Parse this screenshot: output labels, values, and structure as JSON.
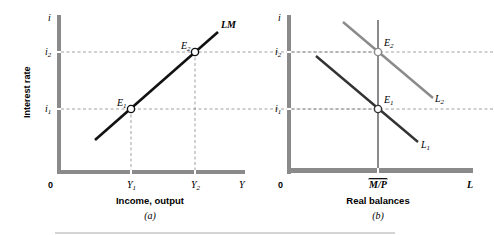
{
  "panel_a": {
    "y_axis_symbol": "i",
    "y_axis_title": "Interest rate",
    "tick_i2": "i",
    "tick_i2_sub": "2",
    "tick_i1": "i",
    "tick_i1_sub": "1",
    "origin": "0",
    "tick_y1": "Y",
    "tick_y1_sub": "1",
    "tick_y2": "Y",
    "tick_y2_sub": "2",
    "x_axis_symbol": "Y",
    "x_axis_title": "Income, output",
    "caption": "(a)",
    "curve_label": "LM",
    "point_e1": "E",
    "point_e1_sub": "1",
    "point_e2": "E",
    "point_e2_sub": "2"
  },
  "panel_b": {
    "y_axis_symbol": "i",
    "tick_i2": "i",
    "tick_i2_sub": "2",
    "tick_i1": "i",
    "tick_i1_sub": "1",
    "origin": "0",
    "tick_mp": "M/P",
    "x_axis_symbol": "L",
    "x_axis_title": "Real balances",
    "caption": "(b)",
    "curve_l1": "L",
    "curve_l1_sub": "1",
    "curve_l2": "L",
    "curve_l2_sub": "2",
    "point_e1": "E",
    "point_e1_sub": "1",
    "point_e2": "E",
    "point_e2_sub": "2"
  },
  "colors": {
    "axis": "#8a8a8a",
    "lm_curve": "#111111",
    "l1_curve": "#333333",
    "l2_curve": "#8a8a8a",
    "dashed": "#888888"
  }
}
